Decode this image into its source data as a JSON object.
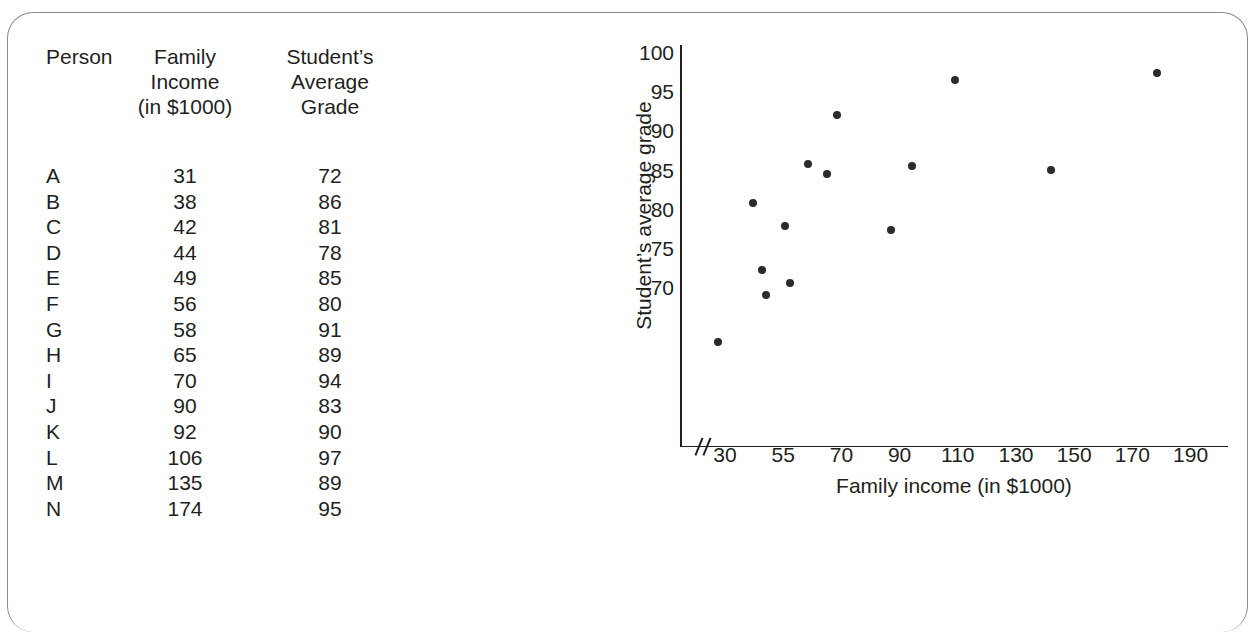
{
  "table": {
    "headers": {
      "person": "Person",
      "income": "Family\nIncome\n(in $1000)",
      "grade": "Student’s\nAverage\nGrade"
    },
    "rows": [
      {
        "person": "A",
        "income": "31",
        "grade": "72"
      },
      {
        "person": "B",
        "income": "38",
        "grade": "86"
      },
      {
        "person": "C",
        "income": "42",
        "grade": "81"
      },
      {
        "person": "D",
        "income": "44",
        "grade": "78"
      },
      {
        "person": "E",
        "income": "49",
        "grade": "85"
      },
      {
        "person": "F",
        "income": "56",
        "grade": "80"
      },
      {
        "person": "G",
        "income": "58",
        "grade": "91"
      },
      {
        "person": "H",
        "income": "65",
        "grade": "89"
      },
      {
        "person": "I",
        "income": "70",
        "grade": "94"
      },
      {
        "person": "J",
        "income": "90",
        "grade": "83"
      },
      {
        "person": "K",
        "income": "92",
        "grade": "90"
      },
      {
        "person": "L",
        "income": "106",
        "grade": "97"
      },
      {
        "person": "M",
        "income": "135",
        "grade": "89"
      },
      {
        "person": "N",
        "income": "174",
        "grade": "95"
      }
    ]
  },
  "chart_data": {
    "type": "scatter",
    "title": "",
    "xlabel": "Family income (in $1000)",
    "ylabel": "Student’s average grade",
    "xticks": [
      "30",
      "55",
      "70",
      "90",
      "110",
      "130",
      "150",
      "170",
      "190"
    ],
    "yticks": [
      "70",
      "75",
      "80",
      "85",
      "90",
      "95",
      "100"
    ],
    "xlim": [
      30,
      190
    ],
    "ylim": [
      70,
      100
    ],
    "axis_break": true,
    "grid": false,
    "legend": null,
    "marker_color": "#2b2b2b",
    "points": [
      {
        "label": "A",
        "x": 31,
        "y": 72,
        "px": 718,
        "py": 342
      },
      {
        "label": "B",
        "x": 38,
        "y": 86,
        "px": 753,
        "py": 203
      },
      {
        "label": "C",
        "x": 42,
        "y": 81,
        "px": 762,
        "py": 270
      },
      {
        "label": "D",
        "x": 44,
        "y": 78,
        "px": 766,
        "py": 295
      },
      {
        "label": "E",
        "x": 49,
        "y": 85,
        "px": 785,
        "py": 226
      },
      {
        "label": "F",
        "x": 56,
        "y": 80,
        "px": 790,
        "py": 283
      },
      {
        "label": "G",
        "x": 58,
        "y": 91,
        "px": 808,
        "py": 164
      },
      {
        "label": "H",
        "x": 65,
        "y": 89,
        "px": 827,
        "py": 174
      },
      {
        "label": "I",
        "x": 70,
        "y": 94,
        "px": 837,
        "py": 115
      },
      {
        "label": "J",
        "x": 90,
        "y": 83,
        "px": 891,
        "py": 230
      },
      {
        "label": "K",
        "x": 92,
        "y": 90,
        "px": 912,
        "py": 166
      },
      {
        "label": "L",
        "x": 106,
        "y": 97,
        "px": 955,
        "py": 80
      },
      {
        "label": "M",
        "x": 135,
        "y": 89,
        "px": 1051,
        "py": 170
      },
      {
        "label": "N",
        "x": 174,
        "y": 95,
        "px": 1157,
        "py": 73
      }
    ]
  }
}
